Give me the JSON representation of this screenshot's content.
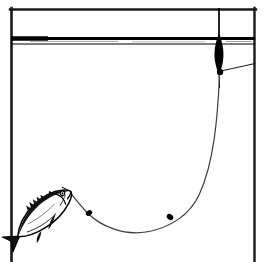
{
  "figure": {
    "title": "Float fishing rig with hooked fish below the surface",
    "caption": "",
    "width": 266,
    "height": 262,
    "background_color": "#ffffff",
    "ink_color": "#000000",
    "style": "black-and-white line drawing"
  },
  "frame": {
    "label": "Illustration border",
    "stroke_color": "#1a1a1a",
    "stroke_width": 2.2,
    "left_x": 11,
    "right_x": 255,
    "top_y": 9,
    "bottom_open": true,
    "bottom_y": 262
  },
  "waterline": {
    "label": "Water surface",
    "stroke_color": "#000000",
    "upper_y": 38,
    "lower_y": 44,
    "upper_thickness": 3.0,
    "lower_thickness": 1.1,
    "left_x": 11,
    "right_x": 255,
    "left_thick_end_x": 46,
    "left_thick_weight": 4.4
  },
  "float": {
    "label": "Float (bobber)",
    "antenna": {
      "label": "Float antenna tip",
      "x": 219,
      "top_y": 8,
      "bottom_y": 44,
      "stroke_width": 1.6,
      "color": "#000000"
    },
    "body": {
      "label": "Float body",
      "center_x": 219,
      "top_y": 36,
      "bottom_y": 72,
      "max_half_width": 5.2,
      "widest_y": 52,
      "color": "#000000"
    },
    "stem": {
      "label": "Float stem",
      "x": 219,
      "top_y": 70,
      "bottom_y": 86,
      "stroke_width": 1.0
    },
    "bead": {
      "label": "Line attachment bead",
      "cx": 220,
      "cy": 72,
      "r": 3.1,
      "color": "#000000"
    }
  },
  "rod_line": {
    "label": "Line to rod tip",
    "stroke_width": 1.0,
    "from_x": 221,
    "from_y": 71,
    "to_x": 255,
    "to_y": 64
  },
  "fishing_line": {
    "label": "Main line from float to fish",
    "stroke_color": "#3a3a3a",
    "stroke_width": 1.15,
    "path": "M 219 76 C 217 120, 213 168, 197 200 C 182 228, 150 236, 124 232 C 104 229, 88 219, 78 206 C 73 199, 70 194, 68 191",
    "hook_end_x": 68,
    "hook_end_y": 191
  },
  "split_shot": {
    "label": "Split shot weights",
    "color": "#000000",
    "items": [
      {
        "label": "split-shot-upper-left",
        "cx": 89,
        "cy": 213,
        "rx": 3.3,
        "ry": 2.6,
        "rotation": -38
      },
      {
        "label": "split-shot-lower-right",
        "cx": 170,
        "cy": 217,
        "rx": 3.4,
        "ry": 2.7,
        "rotation": 34
      }
    ]
  },
  "fish": {
    "label": "Hooked fish",
    "orientation": "head up and to the right, tail down and to the left",
    "body_fill": "#ffffff",
    "outline_color": "#000000",
    "shading_color": "#111111",
    "head_x": 72,
    "head_y": 186,
    "tail_x": 14,
    "tail_y": 239,
    "rotation_deg": -40,
    "eye": {
      "label": "fish-eye",
      "cx": 63,
      "cy": 190,
      "r": 1.6
    },
    "mouth": {
      "label": "fish-mouth",
      "x": 70,
      "y": 190
    }
  },
  "legend": {
    "visible": false,
    "entries": []
  },
  "annotations": {
    "visible": false,
    "items": []
  }
}
